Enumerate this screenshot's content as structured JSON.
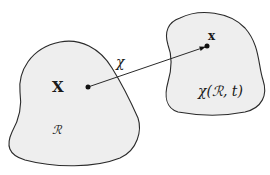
{
  "diagram": {
    "reference_region": {
      "name": "reference configuration",
      "region_label": "ℛ",
      "point_label": "X"
    },
    "current_region": {
      "name": "current configuration",
      "region_label": "χ(ℛ, t)",
      "point_label": "x"
    },
    "mapping": {
      "label": "χ",
      "style": "arrow"
    },
    "colors": {
      "region_fill": "#eeeeee",
      "outline": "#2a2a2a",
      "text": "#1a1a1a"
    }
  }
}
